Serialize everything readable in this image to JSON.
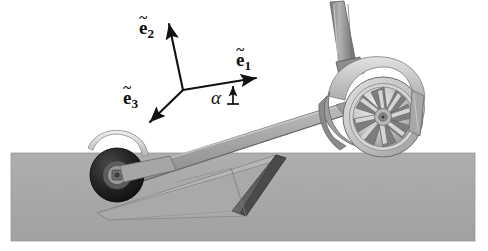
{
  "figure": {
    "background_color": "#ffffff",
    "ground": {
      "name": "ground-plane",
      "color": "#a9a9a9",
      "edge_color": "#9a9a9a"
    },
    "annotations": {
      "e1": {
        "label_base": "e",
        "label_sub": "1",
        "accent": "~"
      },
      "e2": {
        "label_base": "e",
        "label_sub": "2",
        "accent": "~"
      },
      "e3": {
        "label_base": "e",
        "label_sub": "3",
        "accent": "~"
      },
      "alpha": {
        "label": "α"
      }
    },
    "colors": {
      "ink": "#111111",
      "ground": "#a9a9a9",
      "ramp_top": "#b5b5b5",
      "ramp_side": "#5d5d5d",
      "ramp_front": "#a0a0a0",
      "deck": "#a8a8a8",
      "deck_shadow": "#8d8d8d",
      "tire_rear": "#cfcfcf",
      "tire_front": "#1d1d1d",
      "rim": "#d8d8d8",
      "fender": "#c9c9c9",
      "stem": "#8f8f8f"
    },
    "parts": [
      {
        "name": "rear-wheel",
        "label": "rear wheel"
      },
      {
        "name": "rear-rim",
        "label": "alloy spoked rim"
      },
      {
        "name": "rear-fender",
        "label": "rear fender"
      },
      {
        "name": "steering-stem",
        "label": "steering stem"
      },
      {
        "name": "deck",
        "label": "deck"
      },
      {
        "name": "front-wheel",
        "label": "front wheel"
      },
      {
        "name": "front-fender",
        "label": "front fender"
      },
      {
        "name": "wedge-ramp",
        "label": "wedge ramp"
      }
    ]
  }
}
